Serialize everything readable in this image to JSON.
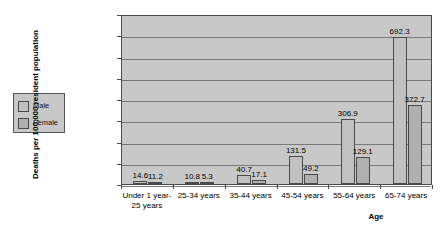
{
  "chart_data": {
    "type": "bar",
    "title": "",
    "subtitle": "",
    "xlabel": "Age",
    "ylabel": "Deaths per 100,000 resident population",
    "ylim": [
      0,
      800
    ],
    "ytick_labels": [
      "800.0",
      "700.0",
      "600.0",
      "500.0",
      "400.0",
      "300.0",
      "200.0",
      "100.0",
      "0.0"
    ],
    "ytick_values": [
      800,
      700,
      600,
      500,
      400,
      300,
      200,
      100,
      0
    ],
    "grid": true,
    "legend_position": "left-outside",
    "categories": [
      "Under 1 year-\n25 years",
      "25-34 years",
      "35-44 years",
      "45-54 years",
      "55-64 years",
      "65-74 years"
    ],
    "category_lines": [
      [
        "Under 1 year-",
        "25 years"
      ],
      [
        "25-34 years"
      ],
      [
        "35-44 years"
      ],
      [
        "45-54 years"
      ],
      [
        "55-64 years"
      ],
      [
        "65-74 years"
      ]
    ],
    "series": [
      {
        "name": "Male",
        "color": "#c0c0c0",
        "values": [
          14.6,
          10.8,
          40.7,
          131.5,
          306.9,
          692.3
        ],
        "labels": [
          "14.6",
          "10.8",
          "40.7",
          "131.5",
          "306.9",
          "692.3"
        ]
      },
      {
        "name": "Female",
        "color": "#b0b0b0",
        "values": [
          11.2,
          5.3,
          17.1,
          49.2,
          129.1,
          372.7
        ],
        "labels": [
          "11.2",
          "5.3",
          "17.1",
          "49.2",
          "129.1",
          "372.7"
        ]
      }
    ]
  },
  "legend": {
    "items": [
      {
        "label": "Male"
      },
      {
        "label": "Female"
      }
    ]
  },
  "colors": {
    "plot_background": "#c8c8c8",
    "gridline": "#7a7a7a",
    "axis": "#4a4a4a",
    "male_bar": "#c0c0c0",
    "female_bar": "#b0b0b0"
  }
}
